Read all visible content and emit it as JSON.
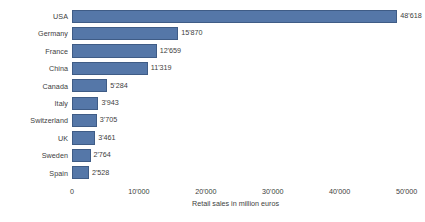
{
  "chart_data": {
    "type": "bar",
    "orientation": "horizontal",
    "title": "",
    "subtitle": "",
    "xlabel": "Retail sales in million euros",
    "ylabel": "",
    "grid": false,
    "legend": null,
    "xlim": [
      0,
      52000
    ],
    "xticks": [
      0,
      10000,
      20000,
      30000,
      40000,
      50000
    ],
    "xtick_labels": [
      "0",
      "10'000",
      "20'000",
      "30'000",
      "40'000",
      "50'000"
    ],
    "bar_color": "#5577a8",
    "bar_edge_color": "#3f5c86",
    "categories": [
      "USA",
      "Germany",
      "France",
      "China",
      "Canada",
      "Italy",
      "Switzerland",
      "UK",
      "Sweden",
      "Spain"
    ],
    "values": [
      48618,
      15870,
      12659,
      11319,
      5284,
      3943,
      3705,
      3461,
      2764,
      2528
    ],
    "value_labels": [
      "48'618",
      "15'870",
      "12'659",
      "11'319",
      "5'284",
      "3'943",
      "3'705",
      "3'461",
      "2'764",
      "2'528"
    ],
    "points": [
      {
        "category": "USA",
        "value": 48618,
        "label": "48'618"
      },
      {
        "category": "Germany",
        "value": 15870,
        "label": "15'870"
      },
      {
        "category": "France",
        "value": 12659,
        "label": "12'659"
      },
      {
        "category": "China",
        "value": 11319,
        "label": "11'319"
      },
      {
        "category": "Canada",
        "value": 5284,
        "label": "5'284"
      },
      {
        "category": "Italy",
        "value": 3943,
        "label": "3'943"
      },
      {
        "category": "Switzerland",
        "value": 3705,
        "label": "3'705"
      },
      {
        "category": "UK",
        "value": 3461,
        "label": "3'461"
      },
      {
        "category": "Sweden",
        "value": 2764,
        "label": "2'764"
      },
      {
        "category": "Spain",
        "value": 2528,
        "label": "2'528"
      }
    ]
  }
}
